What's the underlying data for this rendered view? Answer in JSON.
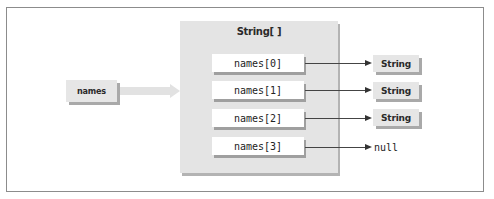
{
  "diagram": {
    "variable": {
      "label": "names"
    },
    "array": {
      "title": "String[ ]",
      "elements": [
        {
          "label": "names[0]",
          "target": "String"
        },
        {
          "label": "names[1]",
          "target": "String"
        },
        {
          "label": "names[2]",
          "target": "String"
        },
        {
          "label": "names[3]",
          "target": "null"
        }
      ]
    },
    "colors": {
      "box_fill": "#e6e6e6",
      "container_fill": "#e4e4e4",
      "element_fill": "#ffffff",
      "shadow": "#a9a9a9",
      "arrow": "#333333",
      "frame_border": "#8c8c8c"
    }
  }
}
